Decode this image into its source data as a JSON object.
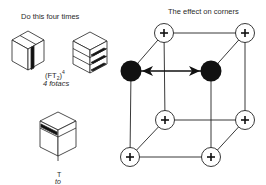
{
  "left_panel": {
    "heading": "Do this four times",
    "move_1": {
      "notation_base": "(FT",
      "notation_sub": "2",
      "notation_close": ")",
      "notation_exp": "4",
      "caption": "4 fotacs"
    },
    "move_2": {
      "notation": "T",
      "caption": "to"
    }
  },
  "right_panel": {
    "heading": "The effect on corners",
    "corners": [
      {
        "id": "back-top-left",
        "x": 164,
        "y": 33,
        "state": "plus",
        "symbol": "+"
      },
      {
        "id": "back-top-right",
        "x": 245,
        "y": 33,
        "state": "plus",
        "symbol": "+"
      },
      {
        "id": "front-top-left",
        "x": 131,
        "y": 71,
        "state": "filled"
      },
      {
        "id": "front-top-right",
        "x": 211,
        "y": 71,
        "state": "filled"
      },
      {
        "id": "back-bottom-left",
        "x": 165,
        "y": 120,
        "state": "plus",
        "symbol": "+"
      },
      {
        "id": "back-bottom-right",
        "x": 245,
        "y": 120,
        "state": "plus",
        "symbol": "+"
      },
      {
        "id": "front-bottom-left",
        "x": 130,
        "y": 157,
        "state": "plus",
        "symbol": "+"
      },
      {
        "id": "front-bottom-right",
        "x": 211,
        "y": 157,
        "state": "plus",
        "symbol": "+"
      }
    ],
    "swap_arrow": {
      "from": "front-top-left",
      "to": "front-top-right",
      "type": "double-headed"
    }
  },
  "colors": {
    "ink": "#111111",
    "text": "#2a2a2a",
    "background": "#ffffff"
  }
}
